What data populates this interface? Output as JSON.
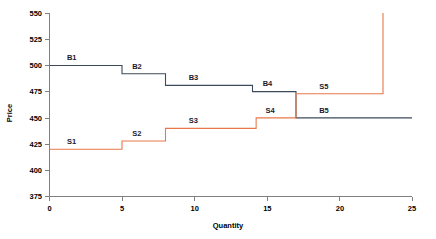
{
  "chart_data": {
    "type": "line",
    "subtype": "step",
    "title": "",
    "xlabel": "Quantity",
    "ylabel": "Price",
    "xlim": [
      0,
      25
    ],
    "ylim": [
      375,
      550
    ],
    "xticks": [
      0,
      5,
      10,
      15,
      20,
      25
    ],
    "xtick_labels": [
      "0",
      "5",
      "10",
      "15",
      "20",
      "25"
    ],
    "yticks": [
      375,
      400,
      425,
      450,
      475,
      500,
      525,
      550
    ],
    "ytick_labels": [
      "375",
      "400",
      "425",
      "450",
      "475",
      "500",
      "525",
      "550"
    ],
    "grid": false,
    "legend": "none",
    "series": [
      {
        "name": "Buy orders",
        "color": "#3c4a5c",
        "steps": [
          {
            "label": "B1",
            "x_start": 0,
            "x_end": 5,
            "price": 500,
            "label_x": 1.2,
            "label_y": 505
          },
          {
            "label": "B2",
            "x_start": 5,
            "x_end": 8,
            "price": 492,
            "label_x": 5.7,
            "label_y": 497
          },
          {
            "label": "B3",
            "x_start": 8,
            "x_end": 14,
            "price": 481,
            "label_x": 9.6,
            "label_y": 486
          },
          {
            "label": "B4",
            "x_start": 14,
            "x_end": 17,
            "price": 475,
            "label_x": 14.7,
            "label_y": 480
          },
          {
            "label": "B5",
            "x_start": 17,
            "x_end": 25,
            "price": 450,
            "label_x": 18.6,
            "label_y": 455
          }
        ]
      },
      {
        "name": "Sell orders",
        "color": "#e8784a",
        "steps": [
          {
            "label": "S1",
            "x_start": 0,
            "x_end": 5,
            "price": 420,
            "label_x": 1.2,
            "label_y": 425
          },
          {
            "label": "S2",
            "x_start": 5,
            "x_end": 8,
            "price": 428,
            "label_x": 5.7,
            "label_y": 433
          },
          {
            "label": "S3",
            "x_start": 8,
            "x_end": 14.25,
            "price": 440,
            "label_x": 9.6,
            "label_y": 445
          },
          {
            "label": "S4",
            "x_start": 14.25,
            "x_end": 17,
            "price": 450,
            "label_x": 14.9,
            "label_y": 455
          },
          {
            "label": "S5",
            "x_start": 17,
            "x_end": 23,
            "price": 473,
            "label_x": 18.6,
            "label_y": 478
          },
          {
            "label": "",
            "x_start": 23,
            "x_end": 23,
            "price": 550,
            "label_x": 0,
            "label_y": 0
          }
        ]
      }
    ]
  },
  "axes": {
    "y_title": "Price",
    "x_title": "Quantity"
  }
}
